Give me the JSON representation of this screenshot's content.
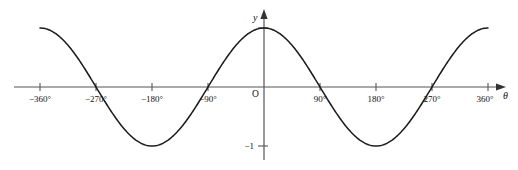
{
  "figure": {
    "kind": "cosine-graph",
    "background_color": "#ffffff",
    "curve_color": "#1a1a1a",
    "axis_color": "#555555",
    "text_color": "#111111"
  },
  "axes": {
    "x_axis_name": "θ",
    "y_axis_name": "y",
    "origin_label": "O",
    "x_tick_labels": [
      "−360°",
      "−270°",
      "−180°",
      "−90°",
      "90°",
      "180°",
      "270°",
      "360°"
    ],
    "y_tick_labels": [
      "−1"
    ]
  },
  "chart_data": {
    "type": "line",
    "title": "",
    "xlabel": "θ",
    "ylabel": "y",
    "grid": false,
    "legend": false,
    "xlim": [
      -405,
      405
    ],
    "ylim": [
      -1.35,
      1.35
    ],
    "x_ticks": [
      -360,
      -270,
      -180,
      -90,
      90,
      180,
      270,
      360
    ],
    "x_tick_labels": [
      "−360°",
      "−270°",
      "−180°",
      "−90°",
      "90°",
      "180°",
      "270°",
      "360°"
    ],
    "y_ticks": [
      -1,
      1
    ],
    "y_tick_labels": [
      "−1",
      ""
    ],
    "series": [
      {
        "name": "y = cos θ",
        "equation": "cos",
        "amplitude": 1,
        "period_deg": 360,
        "phase_deg": 0,
        "x_start": -360,
        "x_end": 360,
        "x": [
          -360,
          -330,
          -300,
          -270,
          -240,
          -210,
          -180,
          -150,
          -120,
          -90,
          -60,
          -30,
          0,
          30,
          60,
          90,
          120,
          150,
          180,
          210,
          240,
          270,
          300,
          330,
          360
        ],
        "values": [
          1,
          0.866,
          0.5,
          0,
          -0.5,
          -0.866,
          -1,
          -0.866,
          -0.5,
          0,
          0.5,
          0.866,
          1,
          0.866,
          0.5,
          0,
          -0.5,
          -0.866,
          -1,
          -0.866,
          -0.5,
          0,
          0.5,
          0.866,
          1
        ]
      }
    ],
    "zero_crossings": [
      -270,
      -90,
      90,
      270
    ],
    "maxima": [
      -360,
      0,
      360
    ],
    "minima": [
      -180,
      180
    ]
  },
  "geometry": {
    "origin_x": 264,
    "origin_y": 87,
    "px_per_90deg": 56,
    "amplitude_px": 59
  }
}
